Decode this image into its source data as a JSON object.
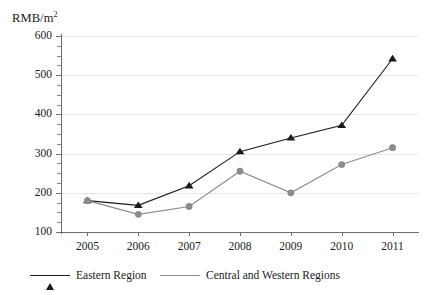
{
  "chart_data": {
    "type": "line",
    "title": "",
    "subtitle": "",
    "xlabel": "",
    "ylabel": "RMB/m²",
    "ylabel_html": "RMB/m<sup>2</sup>",
    "categories": [
      "2005",
      "2006",
      "2007",
      "2008",
      "2009",
      "2010",
      "2011"
    ],
    "x": [
      2005,
      2006,
      2007,
      2008,
      2009,
      2010,
      2011
    ],
    "series": [
      {
        "name": "Eastern Region",
        "color": "#1a1a1a",
        "marker": "triangle",
        "values": [
          180,
          168,
          218,
          305,
          340,
          372,
          542
        ]
      },
      {
        "name": "Central and Western Regions",
        "color": "#8c8c8c",
        "marker": "circle",
        "values": [
          180,
          145,
          165,
          255,
          200,
          272,
          315
        ]
      }
    ],
    "ylim": [
      100,
      600
    ],
    "ytick_values": [
      100,
      200,
      300,
      400,
      500,
      600
    ],
    "ytick_labels": [
      "100",
      "200",
      "300",
      "400",
      "500",
      "600"
    ],
    "ytick_minor_step": 25,
    "grid": true,
    "grid_axis": "y",
    "legend_position": "bottom"
  },
  "legend": {
    "items": [
      {
        "label": "Eastern Region"
      },
      {
        "label": "Central and Western Regions"
      }
    ]
  },
  "colors": {
    "eastern": "#1a1a1a",
    "central_western": "#8c8c8c",
    "grid": "#e6e6e6",
    "axis": "#6e6e6e",
    "background": "#ffffff"
  }
}
